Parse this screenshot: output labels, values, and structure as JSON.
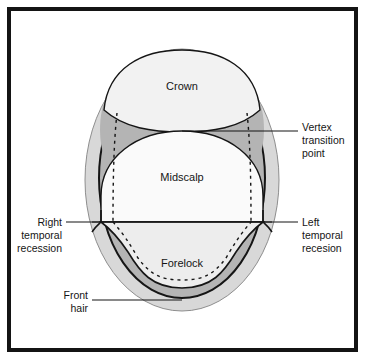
{
  "figure": {
    "frame_color": "#141414",
    "background_color": "#ffffff"
  },
  "colors": {
    "outer_rim": "#d8d8d8",
    "vertex_band": "#b4b4b4",
    "crown_fill": "#f2f2f2",
    "midscalp_fill": "#fafafa",
    "forelock_fill": "#ededed",
    "outline": "#151515",
    "text": "#151515"
  },
  "regions": [
    {
      "id": "crown",
      "label": "Crown",
      "x": 182,
      "y": 86
    },
    {
      "id": "midscalp",
      "label": "Midscalp",
      "x": 182,
      "y": 177
    },
    {
      "id": "forelock",
      "label": "Forelock",
      "x": 182,
      "y": 263
    }
  ],
  "callouts": [
    {
      "id": "vertex-transition-point",
      "lines": [
        "Vertex",
        "transition",
        "point"
      ],
      "x": 302,
      "y": 127,
      "align": "start"
    },
    {
      "id": "right-temporal-recession",
      "lines": [
        "Right",
        "temporal",
        "recession"
      ],
      "x": 62,
      "y": 222,
      "align": "end"
    },
    {
      "id": "left-temporal-recession",
      "lines": [
        "Left",
        "temporal",
        "recesion"
      ],
      "x": 302,
      "y": 222,
      "align": "start"
    },
    {
      "id": "front-hair",
      "lines": [
        "Front",
        "hair"
      ],
      "x": 88,
      "y": 300,
      "align": "end"
    }
  ]
}
